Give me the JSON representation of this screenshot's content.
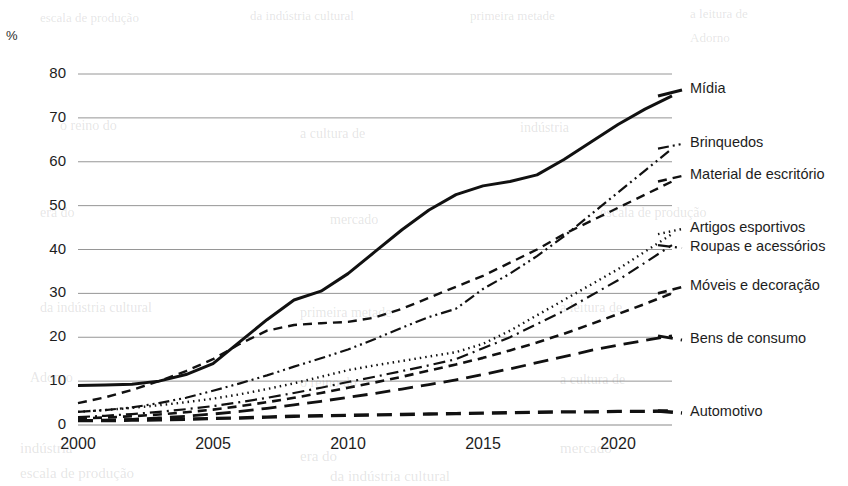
{
  "axis_unit": "%",
  "chart_data": {
    "type": "line",
    "title": "",
    "subtitle": "",
    "xlabel": "",
    "ylabel": "%",
    "xlim": [
      2000,
      2022
    ],
    "ylim": [
      0,
      80
    ],
    "grid": true,
    "grid_axis": "y",
    "legend_position": "right-inline",
    "x_ticks": [
      "2000",
      "2005",
      "2010",
      "2015",
      "2020"
    ],
    "x_tick_values": [
      2000,
      2005,
      2010,
      2015,
      2020
    ],
    "y_ticks": [
      "0",
      "10",
      "20",
      "30",
      "40",
      "50",
      "60",
      "70",
      "80"
    ],
    "y_tick_values": [
      0,
      10,
      20,
      30,
      40,
      50,
      60,
      70,
      80
    ],
    "x": [
      2000,
      2001,
      2002,
      2003,
      2004,
      2005,
      2006,
      2007,
      2008,
      2009,
      2010,
      2011,
      2012,
      2013,
      2014,
      2015,
      2016,
      2017,
      2018,
      2019,
      2020,
      2021,
      2022
    ],
    "series": [
      {
        "name": "Mídia",
        "style": "solid",
        "width": 3.0,
        "color": "#111111",
        "values": [
          9.0,
          9.1,
          9.3,
          10.0,
          11.5,
          14.0,
          19.0,
          24.0,
          28.5,
          30.5,
          34.5,
          39.5,
          44.5,
          49.0,
          52.5,
          54.5,
          55.5,
          57.0,
          60.5,
          64.5,
          68.5,
          72.0,
          75.0
        ]
      },
      {
        "name": "Brinquedos",
        "style": "dashdotdot",
        "width": 2.2,
        "color": "#111111",
        "values": [
          3.0,
          3.4,
          4.0,
          5.0,
          6.2,
          7.8,
          9.5,
          11.3,
          13.3,
          15.2,
          17.2,
          19.6,
          22.2,
          24.6,
          26.5,
          31.0,
          34.5,
          38.5,
          43.0,
          48.0,
          53.0,
          58.0,
          63.0
        ]
      },
      {
        "name": "Material de escritório",
        "style": "dash",
        "width": 2.4,
        "color": "#111111",
        "values": [
          5.0,
          6.3,
          8.0,
          10.0,
          12.3,
          15.0,
          18.5,
          21.5,
          22.8,
          23.2,
          23.5,
          24.5,
          26.5,
          29.0,
          31.5,
          34.0,
          37.0,
          40.0,
          43.5,
          46.5,
          49.5,
          52.5,
          55.5
        ]
      },
      {
        "name": "Artigos esportivos",
        "style": "dot",
        "width": 2.4,
        "color": "#111111",
        "values": [
          3.0,
          3.4,
          3.9,
          4.5,
          5.2,
          6.0,
          7.0,
          8.2,
          9.5,
          11.0,
          12.5,
          13.6,
          14.6,
          15.6,
          16.6,
          18.5,
          21.5,
          25.0,
          28.5,
          32.0,
          35.5,
          39.5,
          43.5
        ]
      },
      {
        "name": "Roupas e acessórios",
        "style": "dashdot",
        "width": 2.2,
        "color": "#111111",
        "values": [
          1.8,
          2.1,
          2.5,
          3.0,
          3.6,
          4.3,
          5.2,
          6.2,
          7.3,
          8.5,
          9.8,
          11.0,
          12.3,
          13.6,
          15.0,
          17.5,
          20.0,
          23.0,
          26.0,
          29.5,
          33.0,
          37.0,
          41.0
        ]
      },
      {
        "name": "Móveis e decoração",
        "style": "dash",
        "width": 2.6,
        "color": "#111111",
        "values": [
          1.5,
          1.7,
          2.0,
          2.4,
          2.9,
          3.5,
          4.3,
          5.2,
          6.2,
          7.3,
          8.5,
          9.7,
          11.0,
          12.4,
          13.8,
          15.3,
          17.0,
          18.8,
          20.8,
          23.0,
          25.3,
          27.6,
          30.0
        ]
      },
      {
        "name": "Bens de consumo",
        "style": "longdash",
        "width": 2.8,
        "color": "#111111",
        "values": [
          1.0,
          1.1,
          1.3,
          1.6,
          2.0,
          2.5,
          3.1,
          3.8,
          4.6,
          5.4,
          6.3,
          7.2,
          8.2,
          9.2,
          10.3,
          11.5,
          12.8,
          14.2,
          15.6,
          17.0,
          18.2,
          19.3,
          20.3
        ]
      },
      {
        "name": "Automotivo",
        "style": "longdash",
        "width": 3.4,
        "color": "#111111",
        "values": [
          1.0,
          1.0,
          1.1,
          1.2,
          1.3,
          1.5,
          1.6,
          1.8,
          2.0,
          2.1,
          2.2,
          2.3,
          2.4,
          2.5,
          2.6,
          2.7,
          2.8,
          2.9,
          3.0,
          3.0,
          3.1,
          3.1,
          3.2
        ]
      }
    ],
    "legend_entries": [
      {
        "label": "Mídia",
        "style": "solid",
        "y": 94
      },
      {
        "label": "Brinquedos",
        "style": "dashdotdot",
        "y": 148
      },
      {
        "label": "Material de escritório",
        "style": "dash",
        "y": 180
      },
      {
        "label": "Artigos esportivos",
        "style": "dot",
        "y": 233
      },
      {
        "label": "Roupas e acessórios",
        "style": "dashdot",
        "y": 252
      },
      {
        "label": "Móveis e decoração",
        "style": "dash",
        "y": 291
      },
      {
        "label": "Bens de consumo",
        "style": "longdash",
        "y": 344
      },
      {
        "label": "Automotivo",
        "style": "longdash",
        "y": 417
      }
    ]
  },
  "colors": {
    "ink": "#111111",
    "grid": "#8a8a8a",
    "text": "#1d1d1d",
    "background": "#ffffff"
  },
  "bleed_text": [
    "escala de produção",
    "da indústria cultural",
    "primeira metade",
    "a leitura de",
    "Adorno",
    "o reino do",
    "a cultura de",
    "indústria",
    "era do",
    "mercado"
  ]
}
